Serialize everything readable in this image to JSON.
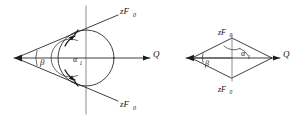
{
  "figure": {
    "background_color": "#ffffff",
    "line_color": "#1c1c1c",
    "axis_color": "#6e6e6e",
    "diagrams": [
      {
        "id": "left-diagram",
        "name": "circle-wedge-diagram",
        "description": "Wedge from left vertex intersecting a circle with vertical axis and horizontal Q axis",
        "labels": {
          "upper_force": {
            "base": "zF",
            "sub": "0"
          },
          "lower_force": {
            "base": "zF",
            "sub": "0"
          },
          "axis": {
            "base": "Q",
            "sub": ""
          },
          "outer_angle": {
            "base": "β",
            "sub": ""
          },
          "inner_angle": {
            "base": "α",
            "sub": "1"
          }
        }
      },
      {
        "id": "right-diagram",
        "name": "rhombus-diagram",
        "description": "Rhombus with horizontal Q axis, vertical center line, apex force labels",
        "labels": {
          "upper_force": {
            "base": "zF",
            "sub": "0"
          },
          "lower_force": {
            "base": "zF",
            "sub": "0"
          },
          "axis": {
            "base": "Q",
            "sub": ""
          },
          "outer_angle": {
            "base": "β",
            "sub": ""
          },
          "inner_angle": {
            "base": "α",
            "sub": "1"
          }
        }
      }
    ]
  }
}
